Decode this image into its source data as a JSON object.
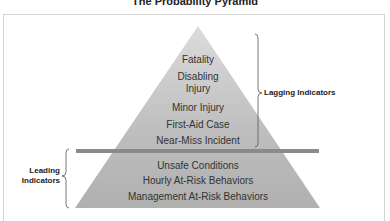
{
  "title": "The Probability Pyramid",
  "colors": {
    "pyramid_fill": "#b5b5b5",
    "pyramid_top": "#d4d4d4",
    "divider": "#8a8a8a",
    "frame": "#d4d4d4",
    "brace": "#555555",
    "text": "#333333"
  },
  "pyramid": {
    "lagging_levels": [
      {
        "label": "Fatality"
      },
      {
        "label": "Disabling Injury"
      },
      {
        "label": "Minor Injury"
      },
      {
        "label": "First-Aid Case"
      },
      {
        "label": "Near-Miss Incident"
      }
    ],
    "leading_levels": [
      {
        "label": "Unsafe Conditions"
      },
      {
        "label": "Hourly At-Risk Behaviors"
      },
      {
        "label": "Management At-Risk Behaviors"
      }
    ]
  },
  "annotations": {
    "lagging": "Lagging Indicators",
    "leading_line1": "Leading",
    "leading_line2": "Indicators"
  }
}
